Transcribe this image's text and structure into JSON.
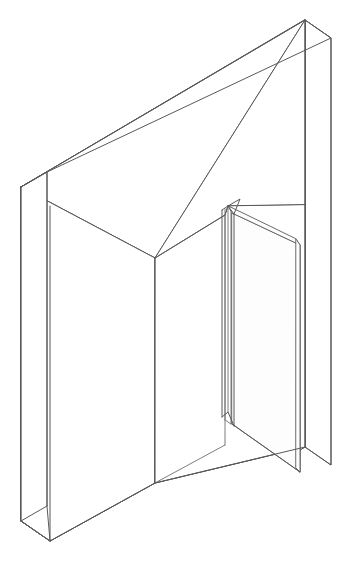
{
  "document": {
    "title": "Isometric Wall With Open Door",
    "subject": "architectural line drawing",
    "caption": ""
  },
  "canvas": {
    "width": 356,
    "height": 565,
    "background": "#ffffff"
  },
  "style": {
    "line_color": "#58585a",
    "line_color_light": "#6e6e70",
    "fill_color": "#ffffff",
    "stroke_width": 1
  },
  "parts": [
    {
      "id": "wall-top-slab",
      "label": "Wall top cap"
    },
    {
      "id": "wall-front-face",
      "label": "Wall front face"
    },
    {
      "id": "wall-right-return",
      "label": "Wall right end return"
    },
    {
      "id": "wall-left-return",
      "label": "Wall left end return"
    },
    {
      "id": "opening-reveal",
      "label": "Door opening reveal"
    },
    {
      "id": "door-leaf",
      "label": "Open door leaf"
    },
    {
      "id": "door-hinge-stile",
      "label": "Door hinge stile"
    }
  ],
  "geometry": {
    "wall": {
      "front_top_left": [
        21,
        187
      ],
      "front_top_right": [
        305,
        20
      ],
      "back_top_left": [
        47,
        172
      ],
      "back_top_right": [
        331,
        38
      ],
      "front_bottom_left": [
        21,
        521
      ],
      "front_bottom_right": [
        305,
        20
      ],
      "right_edge_bottom": [
        331,
        465
      ],
      "left_inner_bottom": [
        50,
        541
      ]
    },
    "opening": {
      "jamb_left_x": 155,
      "jamb_left_top": [
        155,
        258
      ],
      "jamb_left_bottom": [
        155,
        483
      ],
      "header_right": [
        225,
        215
      ],
      "sill_right": [
        225,
        445
      ]
    },
    "door": {
      "hinge_top": [
        228,
        206
      ],
      "hinge_bottom": [
        228,
        412
      ],
      "far_top": [
        300,
        245
      ],
      "far_bottom": [
        300,
        472
      ],
      "thickness_lines": 4
    }
  }
}
